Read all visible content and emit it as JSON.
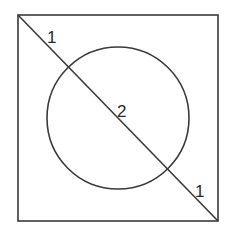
{
  "diagram": {
    "type": "geometry",
    "shapes": {
      "square": {
        "x1": 18,
        "y1": 15,
        "x2": 218,
        "y2": 221
      },
      "circle": {
        "cx": 118,
        "cy": 118,
        "r": 72
      },
      "diagonal": {
        "x1": 18,
        "y1": 15,
        "x2": 218,
        "y2": 221
      }
    },
    "labels": {
      "segment_top_left": "1",
      "segment_middle": "2",
      "segment_bottom_right": "1"
    },
    "colors": {
      "stroke": "#3a3a3a",
      "text": "#2a2a2a",
      "background": "#ffffff"
    }
  }
}
